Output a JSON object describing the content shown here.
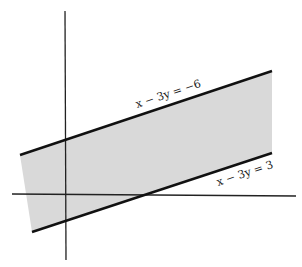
{
  "figure": {
    "colors": {
      "background": "#ffffff",
      "region_fill": "#d9d9d9",
      "lines": "#111111",
      "axes": "#222222"
    },
    "axes": {
      "x_axis": {
        "x1": 12,
        "y1": 194,
        "x2": 296,
        "y2": 196
      },
      "y_axis": {
        "x1": 65,
        "y1": 11,
        "x2": 66,
        "y2": 260
      }
    },
    "lines": [
      {
        "id": "upper",
        "equation": "x − 3y = −6",
        "x1": 20,
        "y1": 155,
        "x2": 272,
        "y2": 71
      },
      {
        "id": "lower",
        "equation": "x − 3y = 3",
        "x1": 32,
        "y1": 232,
        "x2": 272,
        "y2": 153
      }
    ],
    "labels": {
      "upper": {
        "text": "x − 3y = −6",
        "x": 137,
        "y": 108,
        "angle": -18.4
      },
      "lower": {
        "text": "x − 3y = 3",
        "x": 218,
        "y": 186,
        "angle": -18.4
      }
    }
  }
}
